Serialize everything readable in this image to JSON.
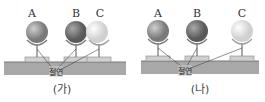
{
  "figure": {
    "panels": [
      {
        "caption": "(가)",
        "insulator_label": "절연",
        "spheres": [
          {
            "label": "A",
            "shade": "medium"
          },
          {
            "label": "B",
            "shade": "dark"
          },
          {
            "label": "C",
            "shade": "light"
          }
        ],
        "arrangement": "B and C in contact"
      },
      {
        "caption": "(나)",
        "insulator_label": "절연",
        "spheres": [
          {
            "label": "A",
            "shade": "medium"
          },
          {
            "label": "B",
            "shade": "dark"
          },
          {
            "label": "C",
            "shade": "light"
          }
        ],
        "arrangement": "all separated"
      }
    ],
    "colors": {
      "ground": "#a8a8a8",
      "medium_sphere": "#8a8a8a",
      "dark_sphere": "#6e6e6e",
      "light_sphere": "#e8e8e8"
    }
  }
}
